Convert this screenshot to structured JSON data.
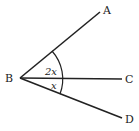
{
  "diagram": {
    "type": "angle-diagram",
    "points": {
      "B": {
        "label": "B",
        "x": 20,
        "y": 78
      },
      "A": {
        "label": "A",
        "x": 100,
        "y": 12
      },
      "C": {
        "label": "C",
        "x": 122,
        "y": 79
      },
      "D": {
        "label": "D",
        "x": 122,
        "y": 118
      }
    },
    "rays": [
      "BA",
      "BC",
      "BD"
    ],
    "angles": [
      {
        "between": "ABC",
        "label": "2x"
      },
      {
        "between": "CBD",
        "label": "x"
      }
    ],
    "colors": {
      "stroke": "#222222",
      "background": "#ffffff"
    }
  }
}
